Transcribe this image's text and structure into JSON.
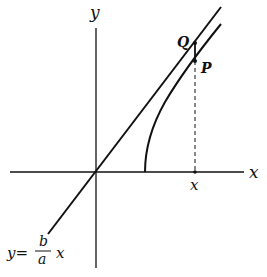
{
  "diagram": {
    "axes": {
      "x_label": "x",
      "y_label": "y"
    },
    "points": {
      "Q": "Q",
      "P": "P"
    },
    "x_tick_label": "x",
    "line_equation": {
      "lhs": "y=",
      "numerator": "b",
      "denominator": "a",
      "variable": "x"
    },
    "colors": {
      "stroke": "#111111",
      "background": "#ffffff"
    }
  }
}
